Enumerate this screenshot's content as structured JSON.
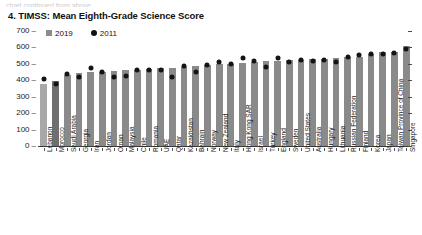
{
  "cut_text": "chart continued from above",
  "title": "4. TIMSS: Mean Eighth-Grade Science Score",
  "legend": [
    {
      "label": "2019",
      "marker": "square",
      "color": "#8c8c8c"
    },
    {
      "label": "2011",
      "marker": "circle",
      "color": "#141414"
    }
  ],
  "axis": {
    "y_ticks": [
      "700",
      "600",
      "500",
      "400",
      "300",
      "200",
      "100",
      "0"
    ],
    "y_min": 0,
    "y_max": 700
  },
  "colors": {
    "bar": "#8a8a8a",
    "bar_highlight": "#6f6f6f",
    "bar_light": "#a8a8a8",
    "dot": "#141414",
    "axis": "#3a3a3a"
  },
  "chart_data": {
    "type": "bar",
    "title": "4. TIMSS: Mean Eighth-Grade Science Score",
    "xlabel": "",
    "ylabel": "",
    "ylim": [
      0,
      700
    ],
    "grid": false,
    "legend_position": "top-left",
    "categories": [
      "Lebanon",
      "Morocco",
      "Saudi Arabia",
      "Georgia",
      "Iran",
      "Jordan",
      "Oman",
      "Malaysia",
      "Chile",
      "Romania",
      "UAE",
      "Qatar",
      "Kazakhstan",
      "Bahrain",
      "Norway",
      "New Zealand",
      "Italy",
      "Hong Kong SAR",
      "Israel",
      "Turkey",
      "England",
      "Sweden",
      "United States",
      "Australia",
      "Hungary",
      "Lithuania",
      "Russian Federation",
      "Finland",
      "Korea",
      "Japan",
      "Taiwan Province of China",
      "Singapore"
    ],
    "series": [
      {
        "name": "2019",
        "marker": "bar",
        "values": [
          377,
          394,
          431,
          447,
          449,
          452,
          457,
          460,
          462,
          470,
          473,
          475,
          478,
          486,
          495,
          499,
          500,
          504,
          513,
          515,
          517,
          521,
          522,
          528,
          530,
          534,
          543,
          543,
          561,
          570,
          574,
          608
        ]
      },
      {
        "name": "2011",
        "marker": "dot",
        "values": [
          406,
          376,
          436,
          420,
          474,
          449,
          420,
          426,
          461,
          465,
          465,
          419,
          490,
          452,
          494,
          512,
          501,
          535,
          516,
          483,
          533,
          509,
          525,
          519,
          522,
          514,
          542,
          552,
          560,
          558,
          564,
          590
        ]
      }
    ]
  }
}
